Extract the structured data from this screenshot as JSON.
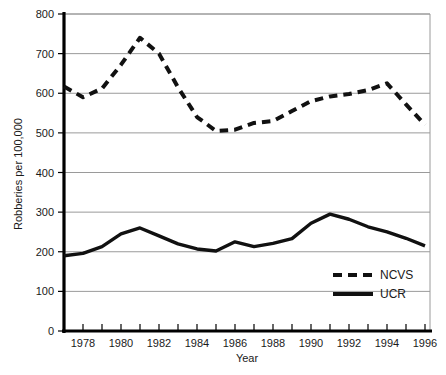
{
  "chart_data": {
    "type": "line",
    "title": "",
    "xlabel": "Year",
    "ylabel": "Robberies per 100,000",
    "xlim": [
      1977,
      1996
    ],
    "ylim": [
      0,
      800
    ],
    "ytick_values": [
      0,
      100,
      200,
      300,
      400,
      500,
      600,
      700,
      800
    ],
    "ytick_labels": [
      "0",
      "100",
      "200",
      "300",
      "400",
      "500",
      "600",
      "700",
      "800"
    ],
    "xtick_values": [
      1977,
      1978,
      1979,
      1980,
      1981,
      1982,
      1983,
      1984,
      1985,
      1986,
      1987,
      1988,
      1989,
      1990,
      1991,
      1992,
      1993,
      1994,
      1995,
      1996
    ],
    "xtick_labels_shown": [
      "1978",
      "1980",
      "1982",
      "1984",
      "1986",
      "1988",
      "1990",
      "1992",
      "1994",
      "1996"
    ],
    "grid": "horizontal",
    "legend_position": "bottom-right",
    "x": [
      1977,
      1978,
      1979,
      1980,
      1981,
      1982,
      1983,
      1984,
      1985,
      1986,
      1987,
      1988,
      1989,
      1990,
      1991,
      1992,
      1993,
      1994,
      1995,
      1996
    ],
    "series": [
      {
        "name": "NCVS",
        "style": "dashed",
        "color": "#111111",
        "values": [
          617,
          590,
          612,
          672,
          740,
          700,
          615,
          540,
          505,
          508,
          525,
          530,
          555,
          580,
          592,
          598,
          608,
          625,
          572,
          520
        ]
      },
      {
        "name": "UCR",
        "style": "solid",
        "color": "#111111",
        "values": [
          190,
          196,
          213,
          245,
          260,
          240,
          220,
          207,
          202,
          225,
          213,
          221,
          233,
          272,
          295,
          282,
          263,
          250,
          234,
          215
        ]
      }
    ]
  },
  "legend": {
    "entries": [
      {
        "label": "NCVS",
        "style": "dashed"
      },
      {
        "label": "UCR",
        "style": "solid"
      }
    ]
  },
  "axes": {
    "y_title": "Robberies per 100,000",
    "x_title": "Year"
  },
  "colors": {
    "line": "#111111",
    "grid": "#9a9a9a",
    "axis": "#000000",
    "background": "#ffffff"
  }
}
